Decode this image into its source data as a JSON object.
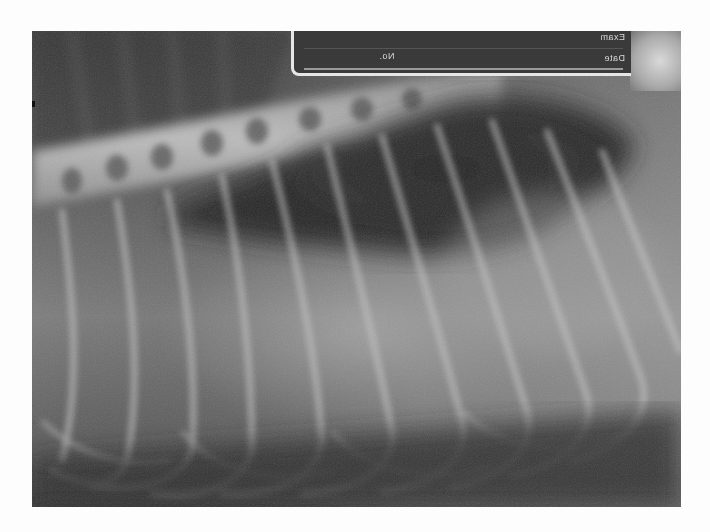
{
  "image": {
    "subject": "Lateral thoracic radiograph",
    "label": {
      "exam_text": "Exam",
      "no_text": "No.",
      "date_text": "Date",
      "mirrored": true
    },
    "colors": {
      "background": "#fdfdfd",
      "film_dark": "#3a3a3a",
      "bone": "#d0d0d0",
      "soft_tissue": "#8a8a8a"
    }
  }
}
